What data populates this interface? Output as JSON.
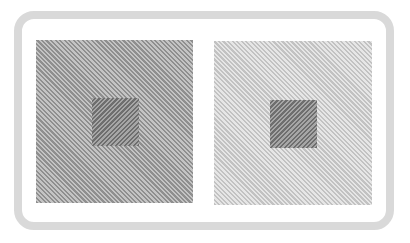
{
  "illusion": {
    "type": "simultaneous-contrast-striped-squares",
    "frame": {
      "border_color": "#d9d9d9",
      "background": "#ffffff"
    },
    "panels": [
      {
        "position": "left",
        "outer_colors": [
          "#8f8f8f",
          "#c4c4c4"
        ],
        "outer_stripe_direction": "diagonal-down-right",
        "inner_colors": [
          "#6e6e6e",
          "#a6a6a6"
        ],
        "inner_stripe_direction": "diagonal-up-right"
      },
      {
        "position": "right",
        "outer_colors": [
          "#c2c2c2",
          "#e6e6e6"
        ],
        "outer_stripe_direction": "diagonal-down-right",
        "inner_colors": [
          "#6e6e6e",
          "#a6a6a6"
        ],
        "inner_stripe_direction": "diagonal-up-right"
      }
    ]
  }
}
